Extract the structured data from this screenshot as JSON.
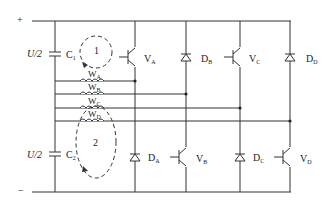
{
  "diagram": {
    "type": "circuit-schematic",
    "colors": {
      "line": "#333333",
      "background": "#ffffff"
    },
    "supply": {
      "plus_label": "+",
      "minus_label": "−",
      "upper_voltage_label": "U/2",
      "lower_voltage_label": "U/2"
    },
    "capacitors": [
      {
        "id": "C1",
        "label": "C",
        "sub": "1"
      },
      {
        "id": "C2",
        "label": "C",
        "sub": "2"
      }
    ],
    "loops": [
      {
        "id": "loop1",
        "label": "1"
      },
      {
        "id": "loop2",
        "label": "2"
      }
    ],
    "windings": [
      {
        "id": "WA",
        "label": "W",
        "sub": "A"
      },
      {
        "id": "WB",
        "label": "W",
        "sub": "B"
      },
      {
        "id": "WC",
        "label": "W",
        "sub": "C"
      },
      {
        "id": "WD",
        "label": "W",
        "sub": "D"
      }
    ],
    "upper_devices": [
      {
        "id": "VA",
        "kind": "transistor",
        "label": "V",
        "sub": "A"
      },
      {
        "id": "DB",
        "kind": "diode",
        "label": "D",
        "sub": "B"
      },
      {
        "id": "VC",
        "kind": "transistor",
        "label": "V",
        "sub": "C"
      },
      {
        "id": "DD",
        "kind": "diode",
        "label": "D",
        "sub": "D"
      }
    ],
    "lower_devices": [
      {
        "id": "DA",
        "kind": "diode",
        "label": "D",
        "sub": "A"
      },
      {
        "id": "VB",
        "kind": "transistor",
        "label": "V",
        "sub": "B"
      },
      {
        "id": "DC",
        "kind": "diode",
        "label": "D",
        "sub": "C"
      },
      {
        "id": "VD",
        "kind": "transistor",
        "label": "V",
        "sub": "D"
      }
    ]
  }
}
